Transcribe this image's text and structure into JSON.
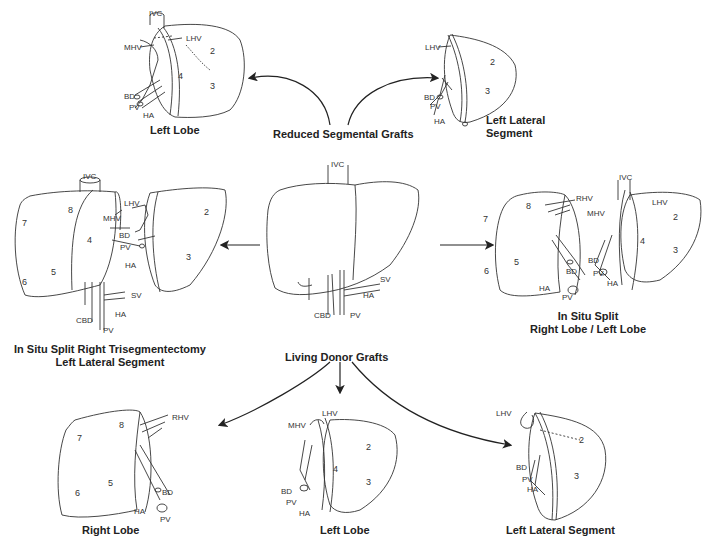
{
  "title_groups": {
    "reduced": "Reduced Segmental Grafts",
    "living": "Living Donor Grafts"
  },
  "panels": {
    "reduced_left_lobe": {
      "caption": "Left Lobe",
      "labels": {
        "ivc": "IVC",
        "mhv": "MHV",
        "lhv": "LHV",
        "bd": "BD",
        "pv": "PV",
        "ha": "HA"
      },
      "segments": [
        "2",
        "3",
        "4"
      ]
    },
    "reduced_left_lateral": {
      "caption_line1": "Left Lateral",
      "caption_line2": "Segment",
      "labels": {
        "lhv": "LHV",
        "bd": "BD",
        "pv": "PV",
        "ha": "HA"
      },
      "segments": [
        "2",
        "3"
      ]
    },
    "whole_liver": {
      "labels": {
        "ivc": "IVC",
        "sv": "SV",
        "ha": "HA",
        "cbd": "CBD",
        "pv": "PV"
      }
    },
    "split_trisegmentectomy": {
      "caption_line1": "In Situ Split Right Trisegmentectomy",
      "caption_line2": "Left Lateral Segment",
      "labels": {
        "ivc": "IVC",
        "lhv": "LHV",
        "mhv": "MHV",
        "bd": "BD",
        "pv": "PV",
        "ha": "HA",
        "sv": "SV",
        "cbd": "CBD",
        "pv2": "PV",
        "ha2": "HA"
      },
      "segments": [
        "8",
        "7",
        "4",
        "5",
        "6",
        "2",
        "3"
      ]
    },
    "split_right_left": {
      "caption_line1": "In Situ Split",
      "caption_line2": "Right Lobe / Left Lobe",
      "labels": {
        "rhv": "RHV",
        "bd": "BD",
        "ha": "HA",
        "pv": "PV",
        "ivc": "IVC",
        "mhv": "MHV",
        "lhv": "LHV",
        "bd2": "BD",
        "pv2": "PV",
        "ha2": "HA"
      },
      "segments": [
        "8",
        "7",
        "5",
        "6",
        "4",
        "2",
        "3"
      ]
    },
    "living_right_lobe": {
      "caption": "Right Lobe",
      "labels": {
        "rhv": "RHV",
        "bd": "BD",
        "ha": "HA",
        "pv": "PV"
      },
      "segments": [
        "8",
        "7",
        "5",
        "6"
      ]
    },
    "living_left_lobe": {
      "caption": "Left Lobe",
      "labels": {
        "lhv": "LHV",
        "mhv": "MHV",
        "bd": "BD",
        "pv": "PV",
        "ha": "HA"
      },
      "segments": [
        "2",
        "4",
        "3"
      ]
    },
    "living_left_lateral": {
      "caption": "Left Lateral Segment",
      "labels": {
        "lhv": "LHV",
        "bd": "BD",
        "pv": "PV",
        "ha": "HA"
      },
      "segments": [
        "2",
        "3"
      ]
    }
  },
  "colors": {
    "line": "#333333",
    "text": "#222222",
    "background": "#ffffff"
  }
}
